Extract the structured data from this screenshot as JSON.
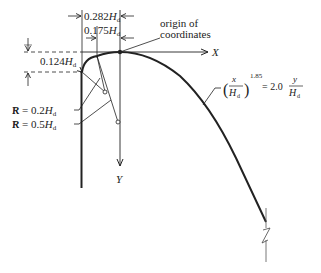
{
  "diagram": {
    "type": "ogee spillway crest profile",
    "labels": {
      "origin": [
        "origin of",
        "coordinates"
      ],
      "x_axis": "X",
      "y_axis": "Y",
      "dim_0282": "0.282",
      "dim_0175": "0.175",
      "dim_0124": "0.124",
      "H": "H",
      "d_sub": "d",
      "radius_small": "R = 0.2",
      "radius_large": "R = 0.5",
      "equation": {
        "numerator_x": "x",
        "denominator_H": "H",
        "exponent": "1.85",
        "equals": "= 2.0",
        "numerator_y": "y"
      }
    },
    "colors": {
      "line": "#222222",
      "background": "#ffffff"
    }
  }
}
